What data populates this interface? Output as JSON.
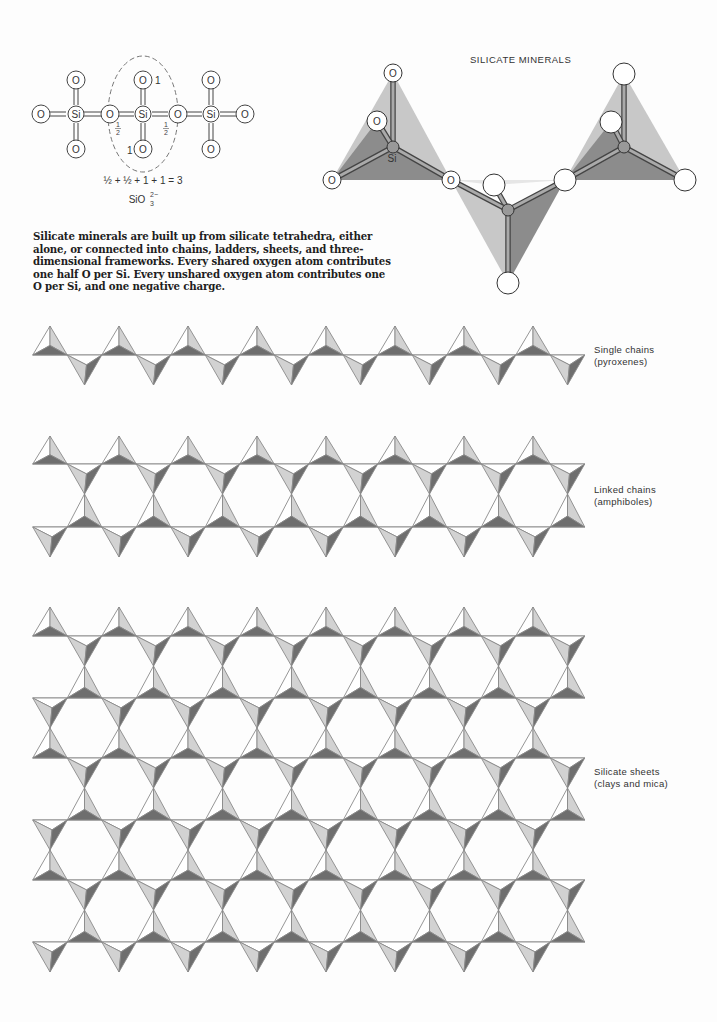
{
  "title": "SILICATE MINERALS",
  "caption": "Silicate minerals are built up from silicate tetrahedra, either alone, or connected into chains, ladders, sheets, and three-dimensional frameworks. Every shared oxygen atom contributes one half O per Si. Every unshared oxygen atom contributes one O per Si, and one negative charge.",
  "structure_diagram": {
    "atoms": {
      "oxygen": "O",
      "silicon": "Si"
    },
    "shared_fraction": "1/2",
    "unshared_value": "1",
    "equation": "½ + ½ + 1 + 1 = 3",
    "formula": "SiO",
    "formula_subscript": "3",
    "formula_superscript": "2−"
  },
  "model_3d": {
    "si_label": "Si",
    "o_label": "O"
  },
  "structures": [
    {
      "id": "single-chains",
      "label_line1": "Single chains",
      "label_line2": "(pyroxenes)"
    },
    {
      "id": "linked-chains",
      "label_line1": "Linked chains",
      "label_line2": "(amphiboles)"
    },
    {
      "id": "silicate-sheets",
      "label_line1": "Silicate sheets",
      "label_line2": "(clays and mica)"
    }
  ],
  "colors": {
    "background": "#fdfdfd",
    "outline": "#8a8a8a",
    "face_light": "#d2d2d2",
    "face_dark": "#6e6e6e",
    "face_white": "#ffffff",
    "model_light": "#c8c8c8",
    "model_dark": "#8c8c8c"
  }
}
